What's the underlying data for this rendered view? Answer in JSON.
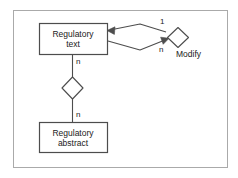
{
  "diagram": {
    "type": "entity-relationship-diagram",
    "frame": {
      "border_color": "#aaaaaa",
      "background": "#ffffff"
    },
    "line_color": "#4d4d4d",
    "text_color": "#1a1a1a",
    "entities": [
      {
        "id": "regulatory-text",
        "line1": "Regulatory",
        "line2": "text"
      },
      {
        "id": "regulatory-abstract",
        "line1": "Regulatory",
        "line2": "abstract"
      }
    ],
    "relationships": [
      {
        "id": "modify",
        "label": "Modify",
        "shape": "diamond",
        "cardinality_from": "1",
        "cardinality_to": "n"
      },
      {
        "id": "composition",
        "label": "",
        "shape": "diamond",
        "cardinality_from": "n",
        "cardinality_to": "n"
      }
    ],
    "cardinalities": {
      "modify_one": "1",
      "modify_many": "n",
      "vertical_top": "n",
      "vertical_bottom": "n"
    }
  }
}
